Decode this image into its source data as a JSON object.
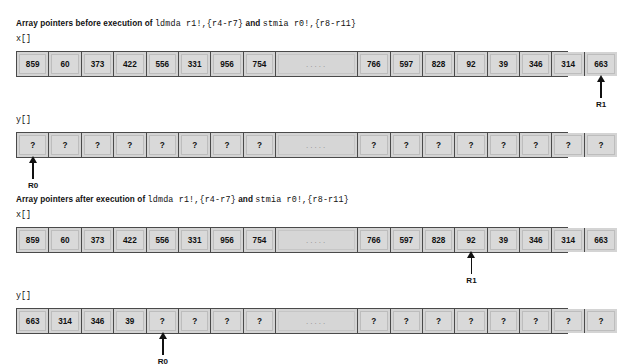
{
  "figure": {
    "title_prefix_before": "Array pointers before execution of ",
    "title_prefix_after": "Array pointers after execution of ",
    "instr_one": "ldmda r1!,{r4-r7}",
    "conjunction": " and ",
    "instr_two": "stmia r0!,{r8-r11}",
    "ellipsis": ".....",
    "unknown": "?"
  },
  "sections": [
    {
      "id": "before",
      "caption_text": "Array pointers before execution of ",
      "x_label": "x[]",
      "y_label": "y[]",
      "x_values": [
        "859",
        "60",
        "373",
        "422",
        "556",
        "331",
        "956",
        "754",
        ".....",
        "766",
        "597",
        "828",
        "92",
        "39",
        "346",
        "314",
        "663"
      ],
      "y_values": [
        "?",
        "?",
        "?",
        "?",
        "?",
        "?",
        "?",
        "?",
        ".....",
        "?",
        "?",
        "?",
        "?",
        "?",
        "?",
        "?",
        "?"
      ],
      "x_pointer": {
        "label": "R1",
        "cell_index": 16
      },
      "y_pointer": {
        "label": "R0",
        "cell_index": 0
      }
    },
    {
      "id": "after",
      "caption_text": "Array pointers after execution of ",
      "x_label": "x[]",
      "y_label": "y[]",
      "x_values": [
        "859",
        "60",
        "373",
        "422",
        "556",
        "331",
        "956",
        "754",
        ".....",
        "766",
        "597",
        "828",
        "92",
        "39",
        "346",
        "314",
        "663"
      ],
      "y_values": [
        "663",
        "314",
        "346",
        "39",
        "?",
        "?",
        "?",
        "?",
        ".....",
        "?",
        "?",
        "?",
        "?",
        "?",
        "?",
        "?",
        "?"
      ],
      "x_pointer": {
        "label": "R1",
        "cell_index": 12
      },
      "y_pointer": {
        "label": "R0",
        "cell_index": 4
      }
    }
  ],
  "colors": {
    "cell_fill": "#d9d9d9",
    "table_border": "#4a4a4a",
    "text": "#111111",
    "ellipsis_text": "#8d8d8d",
    "background": "#ffffff"
  }
}
